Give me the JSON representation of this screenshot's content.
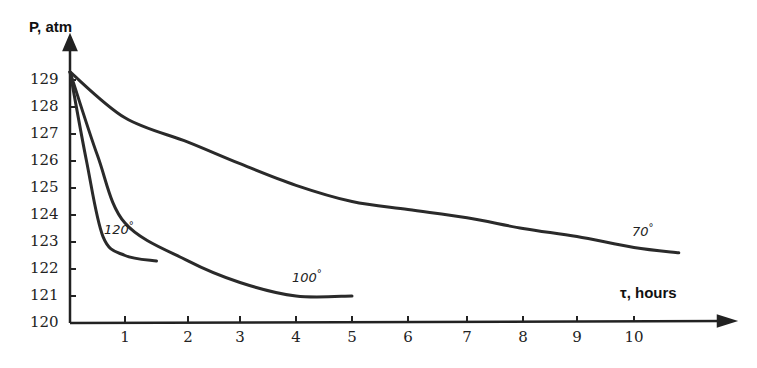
{
  "chart_data": {
    "type": "line",
    "title": "",
    "xlabel": "τ, hours",
    "ylabel": "P, atm",
    "xlim": [
      0,
      11
    ],
    "ylim": [
      120,
      129.5
    ],
    "x_ticks": [
      "1",
      "2",
      "3",
      "4",
      "5",
      "6",
      "7",
      "8",
      "9",
      "10"
    ],
    "y_ticks": [
      "120",
      "121",
      "122",
      "123",
      "124",
      "125",
      "126",
      "127",
      "128",
      "129"
    ],
    "grid": false,
    "legend": "inline curve labels",
    "series": [
      {
        "name": "120°",
        "label": "120",
        "x": [
          0,
          0.3,
          0.6,
          1.0,
          1.5
        ],
        "values": [
          129.3,
          126.0,
          123.2,
          122.5,
          122.3
        ]
      },
      {
        "name": "100°",
        "label": "100",
        "x": [
          0,
          0.5,
          1.0,
          2.0,
          3.0,
          4.0,
          5.0
        ],
        "values": [
          129.3,
          126.2,
          123.7,
          122.3,
          121.5,
          121.0,
          121.0
        ]
      },
      {
        "name": "70°",
        "label": "70",
        "x": [
          0,
          1,
          2,
          3,
          4,
          5,
          6,
          7,
          8,
          9,
          10,
          10.8
        ],
        "values": [
          129.3,
          127.6,
          126.7,
          125.9,
          125.1,
          124.5,
          124.2,
          123.9,
          123.5,
          123.2,
          122.8,
          122.6
        ]
      }
    ]
  },
  "labels": {
    "y_title": "P, atm",
    "x_title": "τ, hours",
    "curve_120": "120",
    "curve_100": "100",
    "curve_70": "70",
    "degree": "°"
  }
}
